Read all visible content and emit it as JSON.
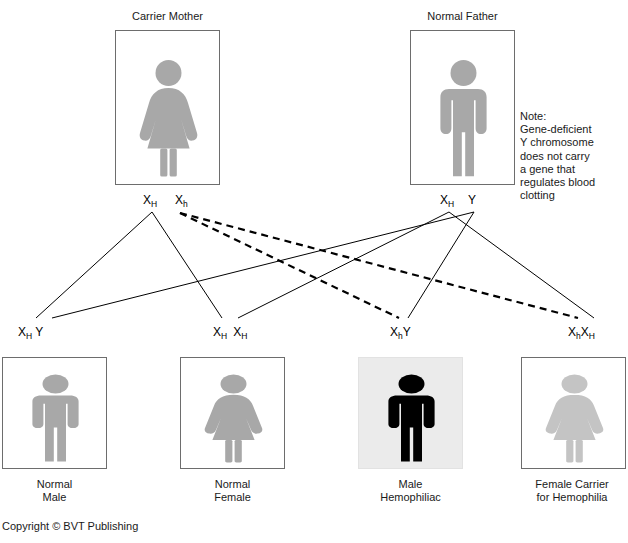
{
  "diagram": {
    "title_not_shown": "",
    "parents": [
      {
        "id": "carrier-mother",
        "caption": "Carrier Mother",
        "figure": "female-figure-icon",
        "figure_color": "#a8a8a8",
        "box": {
          "x": 115,
          "y": 30,
          "w": 105,
          "h": 155
        },
        "caption_pos": {
          "x": 115,
          "y": 10,
          "w": 105
        }
      },
      {
        "id": "normal-father",
        "caption": "Normal Father",
        "figure": "male-figure-icon",
        "figure_color": "#a8a8a8",
        "box": {
          "x": 410,
          "y": 30,
          "w": 105,
          "h": 155
        },
        "caption_pos": {
          "x": 410,
          "y": 10,
          "w": 105
        }
      }
    ],
    "parent_alleles": {
      "mother": [
        {
          "id": "mother-allele-XH",
          "x": "X",
          "sub": "H",
          "y": null,
          "pos": {
            "x": 143,
            "y": 193
          }
        },
        {
          "id": "mother-allele-Xh",
          "x": "X",
          "sub": "h",
          "y": null,
          "pos": {
            "x": 175,
            "y": 193
          }
        }
      ],
      "father": [
        {
          "id": "father-allele-XH",
          "x": "X",
          "sub": "H",
          "y": null,
          "pos": {
            "x": 440,
            "y": 193
          }
        },
        {
          "id": "father-allele-Y",
          "x": "Y",
          "sub": "",
          "y": null,
          "pos": {
            "x": 467,
            "y": 193
          }
        }
      ]
    },
    "offspring": [
      {
        "id": "normal-male",
        "genotype": [
          {
            "letter": "X",
            "sub": "H"
          },
          {
            "letter": "Y",
            "sub": ""
          }
        ],
        "genotype_pos": {
          "x": 18,
          "y": 325
        },
        "caption": "Normal\nMale",
        "caption_pos": {
          "x": 2,
          "y": 478,
          "w": 105
        },
        "figure": "male-figure-icon",
        "figure_color": "#a8a8a8",
        "shaded": false,
        "box": {
          "x": 2,
          "y": 357,
          "w": 105,
          "h": 112
        }
      },
      {
        "id": "normal-female",
        "genotype": [
          {
            "letter": "X",
            "sub": "H"
          },
          {
            "letter": "X",
            "sub": "H"
          }
        ],
        "genotype_pos": {
          "x": 213,
          "y": 325
        },
        "caption": "Normal\nFemale",
        "caption_pos": {
          "x": 180,
          "y": 478,
          "w": 105
        },
        "figure": "female-figure-icon",
        "figure_color": "#a8a8a8",
        "shaded": false,
        "box": {
          "x": 180,
          "y": 357,
          "w": 105,
          "h": 112
        }
      },
      {
        "id": "male-hemophiliac",
        "genotype": [
          {
            "letter": "X",
            "sub": "h"
          },
          {
            "letter": "Y",
            "sub": ""
          }
        ],
        "genotype_pos": {
          "x": 390,
          "y": 325
        },
        "caption": "Male\nHemophiliac",
        "caption_pos": {
          "x": 358,
          "y": 478,
          "w": 105
        },
        "figure": "male-figure-icon",
        "figure_color": "#000000",
        "shaded": true,
        "box": {
          "x": 358,
          "y": 357,
          "w": 105,
          "h": 112
        }
      },
      {
        "id": "female-carrier",
        "genotype": [
          {
            "letter": "X",
            "sub": "h"
          },
          {
            "letter": "X",
            "sub": "H"
          }
        ],
        "genotype_pos": {
          "x": 568,
          "y": 325
        },
        "caption": "Female Carrier\nfor Hemophilia",
        "caption_pos": {
          "x": 518,
          "y": 478,
          "w": 108
        },
        "figure": "female-figure-icon",
        "figure_color": "#c4c4c4",
        "shaded": false,
        "box": {
          "x": 521,
          "y": 357,
          "w": 105,
          "h": 112
        }
      }
    ],
    "note": {
      "id": "note-text",
      "text": "Note:\nGene-deficient\nY chromosome\ndoes not carry\na gene that\nregulates blood\nclotting",
      "pos": {
        "x": 520,
        "y": 110
      }
    },
    "copyright": {
      "id": "copyright-text",
      "text": "Copyright © BVT Publishing",
      "pos": {
        "x": 2,
        "y": 520
      }
    },
    "inheritance_lines": [
      {
        "from": "mother-allele-XH",
        "to": "normal-male",
        "style": "solid",
        "x1": 152,
        "y1": 212,
        "x2": 36,
        "y2": 318
      },
      {
        "from": "mother-allele-XH",
        "to": "normal-female",
        "style": "solid",
        "x1": 152,
        "y1": 212,
        "x2": 222,
        "y2": 318
      },
      {
        "from": "mother-allele-Xh",
        "to": "male-hemophiliac",
        "style": "dashed",
        "x1": 180,
        "y1": 213,
        "x2": 399,
        "y2": 318
      },
      {
        "from": "mother-allele-Xh",
        "to": "female-carrier",
        "style": "dashed",
        "x1": 180,
        "y1": 213,
        "x2": 578,
        "y2": 318
      },
      {
        "from": "father-allele-XH",
        "to": "normal-female",
        "style": "solid",
        "x1": 449,
        "y1": 212,
        "x2": 238,
        "y2": 318
      },
      {
        "from": "father-allele-XH",
        "to": "female-carrier",
        "style": "solid",
        "x1": 449,
        "y1": 212,
        "x2": 594,
        "y2": 318
      },
      {
        "from": "father-allele-Y",
        "to": "normal-male",
        "style": "solid",
        "x1": 474,
        "y1": 212,
        "x2": 52,
        "y2": 318
      },
      {
        "from": "father-allele-Y",
        "to": "male-hemophiliac",
        "style": "solid",
        "x1": 474,
        "y1": 212,
        "x2": 408,
        "y2": 318
      }
    ],
    "colors": {
      "figure_gray": "#a8a8a8",
      "figure_light_gray": "#c4c4c4",
      "figure_black": "#000000",
      "box_border": "#6d6d6d",
      "shaded_bg": "#ebebeb",
      "line": "#000000"
    }
  }
}
